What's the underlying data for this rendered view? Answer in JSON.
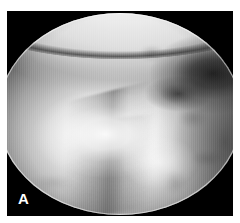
{
  "figure": {
    "panel_label": "A",
    "modality": "arthroscopy",
    "caption": "",
    "background_color": "#ffffff",
    "frame_color": "#000000",
    "label_color": "#ffffff"
  },
  "photo": {
    "alt_text": "Arthroscopic view of the knee joint",
    "field_of_view_shape": "circle",
    "color_mode": "grayscale",
    "features": [
      {
        "name": "femoral-condyle",
        "description": "bright convex articular surface across the upper field"
      },
      {
        "name": "condyle-sulcus",
        "description": "dark line beneath the condyle"
      },
      {
        "name": "meniscal-cleft",
        "description": "dark notch at the upper right"
      },
      {
        "name": "meniscus-edge",
        "description": "diagonal tissue border running lower-left to mid-right"
      },
      {
        "name": "cartilage-crease",
        "description": "secondary soft crease below the main edge"
      },
      {
        "name": "specular-highlight",
        "description": "central light-source glare"
      },
      {
        "name": "lateral-shadow",
        "description": "shadowed textured tissue along the right flank"
      }
    ]
  }
}
